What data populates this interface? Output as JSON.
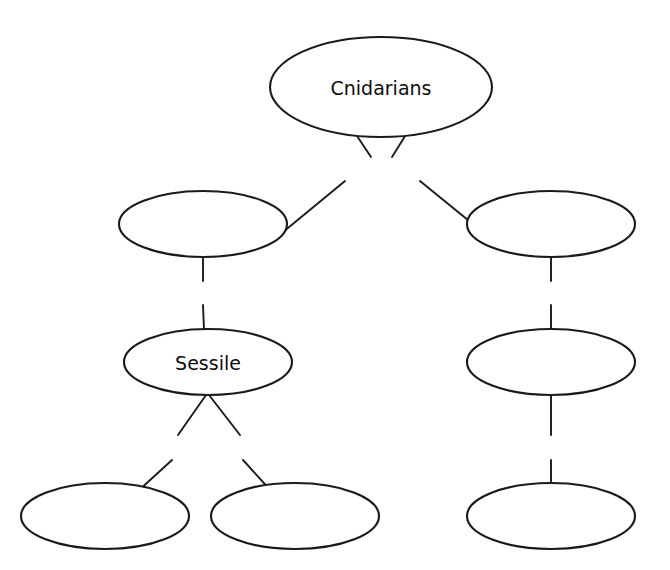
{
  "diagram": {
    "type": "concept-map",
    "background_color": "#ffffff",
    "stroke_color": "#1a1a1a",
    "text_color": "#0d0d0d",
    "nodes": [
      {
        "id": "root",
        "label": "Cnidarians",
        "filled": true,
        "cx": 381,
        "cy": 87,
        "rx": 111,
        "ry": 50
      },
      {
        "id": "mid-left",
        "label": "",
        "filled": false,
        "cx": 203,
        "cy": 224,
        "rx": 84,
        "ry": 33
      },
      {
        "id": "mid-right",
        "label": "",
        "filled": false,
        "cx": 551,
        "cy": 224,
        "rx": 84,
        "ry": 33
      },
      {
        "id": "third-left",
        "label": "Sessile",
        "filled": true,
        "cx": 208,
        "cy": 362,
        "rx": 84,
        "ry": 33
      },
      {
        "id": "third-right",
        "label": "",
        "filled": false,
        "cx": 551,
        "cy": 362,
        "rx": 84,
        "ry": 33
      },
      {
        "id": "leaf-1",
        "label": "",
        "filled": false,
        "cx": 105,
        "cy": 516,
        "rx": 84,
        "ry": 33
      },
      {
        "id": "leaf-2",
        "label": "",
        "filled": false,
        "cx": 295,
        "cy": 516,
        "rx": 84,
        "ry": 33
      },
      {
        "id": "leaf-3",
        "label": "",
        "filled": false,
        "cx": 551,
        "cy": 516,
        "rx": 84,
        "ry": 33
      }
    ],
    "links": [
      {
        "id": "link-body-types",
        "label": "body types",
        "from": "root",
        "to": [
          "mid-left",
          "mid-right"
        ],
        "label_x": 381,
        "label_y": 168
      },
      {
        "id": "link-is-left",
        "label": "is",
        "from": "mid-left",
        "to": [
          "third-left"
        ],
        "label_x": 203,
        "label_y": 293
      },
      {
        "id": "link-is-right",
        "label": "is",
        "from": "mid-right",
        "to": [
          "third-right"
        ],
        "label_x": 551,
        "label_y": 293
      },
      {
        "id": "link-examples-left",
        "label": "examples",
        "from": "third-left",
        "to": [
          "leaf-1",
          "leaf-2"
        ],
        "label_x": 207,
        "label_y": 447
      },
      {
        "id": "link-examples-right",
        "label": "examples",
        "from": "third-right",
        "to": [
          "leaf-3"
        ],
        "label_x": 551,
        "label_y": 447
      }
    ]
  }
}
